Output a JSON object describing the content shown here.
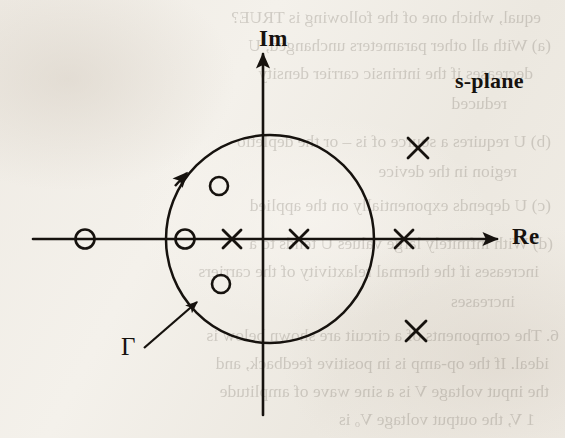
{
  "figure": {
    "title": "s-plane",
    "type": "pole-zero-plot-with-nyquist-contour",
    "axes": {
      "real": {
        "label": "Re",
        "orientation": "horizontal",
        "arrow": "right",
        "y": 239
      },
      "imag": {
        "label": "Im",
        "orientation": "vertical",
        "arrow": "up",
        "x": 263
      }
    },
    "contour": {
      "label": "Γ",
      "shape": "circle",
      "center_x": 270,
      "center_y": 239,
      "radius": 104,
      "direction": "counter-clockwise",
      "direction_arrow_angle_deg": 143,
      "callout_arrow": {
        "from_x": 146,
        "from_y": 345,
        "to_x": 196,
        "to_y": 303
      }
    },
    "zeros": [
      {
        "name": "zero-real-outer-left",
        "x": 85,
        "y": 239,
        "marker": "circle",
        "inside_contour": false
      },
      {
        "name": "zero-real-inner-left",
        "x": 185,
        "y": 239,
        "marker": "circle",
        "inside_contour": true
      },
      {
        "name": "zero-upper-inner",
        "x": 219,
        "y": 186,
        "marker": "circle",
        "inside_contour": true
      },
      {
        "name": "zero-lower-inner",
        "x": 221,
        "y": 284,
        "marker": "circle",
        "inside_contour": true
      }
    ],
    "poles": [
      {
        "name": "pole-real-left",
        "x": 232,
        "y": 239,
        "marker": "cross",
        "inside_contour": true
      },
      {
        "name": "pole-real-middle",
        "x": 299,
        "y": 239,
        "marker": "cross",
        "inside_contour": true
      },
      {
        "name": "pole-real-right",
        "x": 404,
        "y": 239,
        "marker": "cross",
        "inside_contour": false
      },
      {
        "name": "pole-upper-right",
        "x": 418,
        "y": 148,
        "marker": "cross",
        "inside_contour": false
      },
      {
        "name": "pole-lower-right",
        "x": 416,
        "y": 331,
        "marker": "cross",
        "inside_contour": false
      }
    ],
    "colors": {
      "ink": "#16120e",
      "paper": "#f2eee8",
      "bleed_text": "#6d665c"
    }
  },
  "bleed_through_text": [
    {
      "text": "equal, which one of the following is TRUE?",
      "x": 24,
      "y": 2
    },
    {
      "text": "(a) With all other parameters unchanged, U",
      "x": 14,
      "y": 30
    },
    {
      "text": "decreases if the intrinsic carrier density",
      "x": 32,
      "y": 58
    },
    {
      "text": "reduced",
      "x": 58,
      "y": 88
    },
    {
      "text": "(b) U requires a source of is – or the depletio",
      "x": 14,
      "y": 126
    },
    {
      "text": "region in the device",
      "x": 48,
      "y": 156
    },
    {
      "text": "(c) U depends exponentially on the applied",
      "x": 14,
      "y": 190
    },
    {
      "text": "(d) With infinitely large values U tends to a",
      "x": 12,
      "y": 228
    },
    {
      "text": "increases if the thermal relaxtivity of the carriers",
      "x": 26,
      "y": 256
    },
    {
      "text": "increases",
      "x": 50,
      "y": 286
    },
    {
      "text": "6. The components of a circuit are shown below is",
      "x": 6,
      "y": 320
    },
    {
      "text": "ideal. If the op-amp is in positive feedback, and",
      "x": 16,
      "y": 348
    },
    {
      "text": "the input voltage V is a sine wave of amplitude",
      "x": 16,
      "y": 376
    },
    {
      "text": "1 V, the output voltage Vₒ is",
      "x": 30,
      "y": 404
    }
  ]
}
